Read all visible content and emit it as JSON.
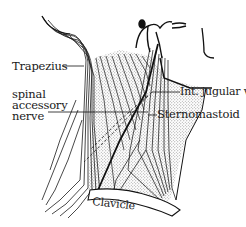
{
  "figure": {
    "type": "anatomical line drawing",
    "colors": {
      "ink": "#1a1a1a",
      "stipple": "#b8b8b8",
      "paper": "#ffffff"
    }
  },
  "labels": {
    "trapezius": "Trapezius",
    "spinal_accessory_nerve": [
      "spinal",
      "accessory",
      "nerve"
    ],
    "int_jugular_v": "Int. jugular v.",
    "sternomastoid": "Sternomastoid",
    "clavicle": "Clavicle"
  }
}
